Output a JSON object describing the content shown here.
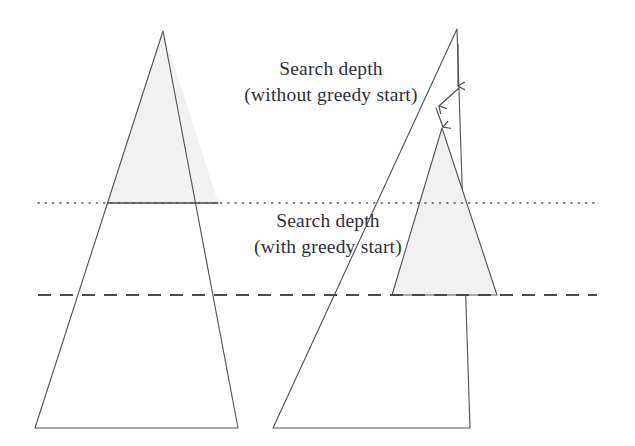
{
  "figure": {
    "background_color": "#ffffff",
    "stroke_color": "#55555f",
    "fill_color": "#f1f1f1",
    "text_color": "#2f2f38",
    "width": 635,
    "height": 446
  },
  "captions": {
    "without_greedy": {
      "line1": "Search depth",
      "line2": "(without greedy start)"
    },
    "with_greedy": {
      "line1": "Search depth",
      "line2": "(with greedy start)"
    }
  },
  "guide_lines": {
    "dotted": {
      "name": "search-depth-without-greedy-line",
      "style": "dotted",
      "y": 203,
      "x_start": 38,
      "x_end": 597,
      "color": "#55555f"
    },
    "dashed": {
      "name": "search-depth-with-greedy-line",
      "style": "dashed",
      "y": 295,
      "x_start": 38,
      "x_end": 597,
      "color": "#4a4a54"
    }
  },
  "shapes": {
    "left_tree": {
      "label": "full-search-tree",
      "apex": [
        163,
        31
      ],
      "base_left": [
        35,
        428
      ],
      "base_right": [
        238,
        428
      ],
      "shaded_to_y": 203
    },
    "right_outer_tree": {
      "label": "full-search-tree",
      "apex": [
        457,
        29
      ],
      "base_left": [
        273,
        428
      ],
      "base_right": [
        470,
        428
      ]
    },
    "right_inner_tree": {
      "label": "greedy-start-search-tree",
      "apex": [
        442,
        128
      ],
      "base_left": [
        392,
        295
      ],
      "base_right": [
        497,
        295
      ],
      "shaded": true
    }
  },
  "arrows": [
    {
      "name": "greedy-descent-arrow-1",
      "from": [
        458,
        45
      ],
      "to": [
        458,
        88
      ]
    },
    {
      "name": "greedy-descent-arrow-2",
      "from": [
        458,
        89
      ],
      "to": [
        437,
        108
      ]
    },
    {
      "name": "greedy-descent-arrow-3",
      "from": [
        437,
        108
      ],
      "to": [
        443,
        128
      ]
    }
  ]
}
